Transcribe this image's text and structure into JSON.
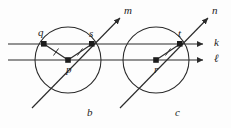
{
  "figure": {
    "background_color": "#fdfdfd",
    "stroke_color": "#2b2b2b",
    "label_color": "#1c1c1c",
    "width": 231,
    "height": 128
  },
  "circles": [
    {
      "name": "circle-b",
      "center_label": "p",
      "curve_label": "b",
      "cx": 68,
      "cy": 60,
      "r": 33
    },
    {
      "name": "circle-c",
      "center_label": "r",
      "curve_label": "c",
      "cx": 156,
      "cy": 60,
      "r": 33
    }
  ],
  "lines": [
    {
      "name": "line-k",
      "label": "k",
      "kind": "horizontal",
      "y": 44,
      "x1": 8,
      "x2": 205,
      "arrow": "right"
    },
    {
      "name": "line-l",
      "label": "ℓ",
      "kind": "horizontal",
      "y": 60,
      "x1": 8,
      "x2": 205,
      "arrow": "right"
    },
    {
      "name": "line-m",
      "label": "m",
      "kind": "diagonal",
      "x1": 32,
      "y1": 108,
      "x2": 122,
      "y2": 16,
      "arrow": "up-right"
    },
    {
      "name": "line-n",
      "label": "n",
      "kind": "diagonal",
      "x1": 120,
      "y1": 108,
      "x2": 210,
      "y2": 16,
      "arrow": "up-right"
    }
  ],
  "points": [
    {
      "name": "point-q",
      "label": "q",
      "x": 44,
      "y": 44,
      "label_dx": -4,
      "label_dy": -14
    },
    {
      "name": "point-s",
      "label": "s",
      "x": 92,
      "y": 44,
      "label_dx": -4,
      "label_dy": -14
    },
    {
      "name": "point-p",
      "label": "p",
      "x": 68,
      "y": 60,
      "label_dx": -1,
      "label_dy": 4
    },
    {
      "name": "point-t",
      "label": "t",
      "x": 180,
      "y": 44,
      "label_dx": -2,
      "label_dy": -14
    },
    {
      "name": "point-r",
      "label": "r",
      "x": 156,
      "y": 60,
      "label_dx": -2,
      "label_dy": 4
    }
  ],
  "segments": [
    {
      "name": "segment-qp",
      "from": "q",
      "to": "p",
      "x1": 44,
      "y1": 44,
      "x2": 68,
      "y2": 60,
      "tick_marks": 1
    },
    {
      "name": "segment-ps",
      "from": "p",
      "to": "s",
      "x1": 68,
      "y1": 60,
      "x2": 92,
      "y2": 44,
      "tick_marks": 1
    },
    {
      "name": "segment-rt",
      "from": "r",
      "to": "t",
      "x1": 156,
      "y1": 60,
      "x2": 180,
      "y2": 44,
      "tick_marks": 1
    }
  ],
  "labels": {
    "q": "q",
    "s": "s",
    "p": "p",
    "t": "t",
    "r": "r",
    "b": "b",
    "c": "c",
    "k": "k",
    "l": "ℓ",
    "m": "m",
    "n": "n"
  },
  "label_positions": {
    "q": {
      "x": 38,
      "y": 28
    },
    "s": {
      "x": 88,
      "y": 28
    },
    "p": {
      "x": 66,
      "y": 64
    },
    "t": {
      "x": 177,
      "y": 28
    },
    "r": {
      "x": 153,
      "y": 64
    },
    "b": {
      "x": 88,
      "y": 110
    },
    "c": {
      "x": 176,
      "y": 110
    },
    "k": {
      "x": 215,
      "y": 37
    },
    "l": {
      "x": 215,
      "y": 54
    },
    "m": {
      "x": 125,
      "y": 4
    },
    "n": {
      "x": 214,
      "y": 4
    }
  }
}
